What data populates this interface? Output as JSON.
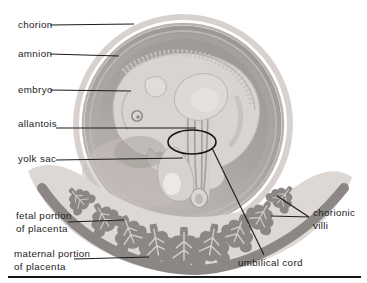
{
  "figure": {
    "width": 367,
    "height": 283,
    "background": "#ffffff"
  },
  "palette": {
    "label_text": "#1c1c1c",
    "leader_line": "#1c1c1c",
    "annotation_line": "#151515",
    "baseline_rule": "#151515",
    "ring_light": "#d8d2cf",
    "membrane_line": "#b9b3b0",
    "cavity_dark": "#9e9895",
    "cavity_light": "#c0bab6",
    "embryo_body": "#dad4d0",
    "embryo_outline": "#b7b1ad",
    "highlight": "#ece8e5",
    "placenta_light": "#ded8d4",
    "villi_dark": "#8c8784",
    "villi_vein": "#d2ccc8"
  },
  "labels": [
    {
      "id": "chorion",
      "lines": [
        "chorion"
      ],
      "x": 18,
      "y": 28,
      "leaders": [
        [
          50,
          25,
          134,
          24
        ]
      ]
    },
    {
      "id": "amnion",
      "lines": [
        "amnion"
      ],
      "x": 18,
      "y": 57,
      "leaders": [
        [
          50,
          54,
          119,
          56
        ]
      ]
    },
    {
      "id": "embryo",
      "lines": [
        "embryo"
      ],
      "x": 18,
      "y": 93,
      "leaders": [
        [
          50,
          90,
          131,
          91
        ]
      ]
    },
    {
      "id": "allantois",
      "lines": [
        "allantois"
      ],
      "x": 18,
      "y": 127,
      "leaders": [
        [
          56,
          128,
          196,
          128
        ]
      ]
    },
    {
      "id": "yolk-sac",
      "lines": [
        "yolk sac"
      ],
      "x": 18,
      "y": 162,
      "leaders": [
        [
          56,
          160,
          183,
          158
        ]
      ]
    },
    {
      "id": "fetal-portion",
      "lines": [
        "fetal portion",
        "of placenta"
      ],
      "x": 16,
      "y": 219,
      "leaders": [
        [
          68,
          222,
          124,
          220
        ]
      ]
    },
    {
      "id": "maternal-portion",
      "lines": [
        "maternal portion",
        "of placenta"
      ],
      "x": 14,
      "y": 257,
      "leaders": [
        [
          74,
          259,
          149,
          257
        ]
      ]
    },
    {
      "id": "chorionic-villi",
      "lines": [
        "chorionic",
        "villi"
      ],
      "x": 313,
      "y": 216,
      "leaders": [
        [
          309,
          217,
          277,
          196
        ],
        [
          309,
          217,
          271,
          216
        ]
      ]
    },
    {
      "id": "umbilical-cord",
      "lines": [
        "umbilical cord"
      ],
      "x": 238,
      "y": 266,
      "leaders": [
        [
          264,
          255,
          212,
          148
        ]
      ]
    }
  ],
  "annotations": {
    "cord_ellipse": {
      "cx": 192,
      "cy": 142,
      "rx": 24,
      "ry": 12
    }
  },
  "rule": {
    "x1": 8,
    "y1": 277,
    "x2": 361,
    "y2": 277
  },
  "label_line_height": 13
}
